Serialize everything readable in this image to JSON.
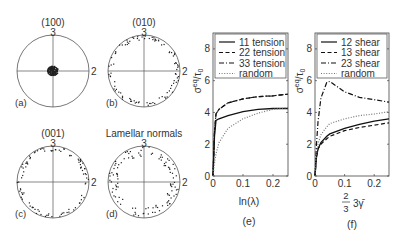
{
  "pole_figures": [
    {
      "id": "a",
      "title": "(100)",
      "panel_label": "(a)",
      "axis_top": "3",
      "axis_right": "2",
      "cx": 53,
      "cy": 71,
      "r": 36,
      "distribution": "center"
    },
    {
      "id": "b",
      "title": "(010)",
      "panel_label": "(b)",
      "axis_top": "3",
      "axis_right": "2",
      "cx": 144,
      "cy": 71,
      "r": 36,
      "distribution": "rim"
    },
    {
      "id": "c",
      "title": "(001)",
      "panel_label": "(c)",
      "axis_top": "3",
      "axis_right": "2",
      "cx": 53,
      "cy": 182,
      "r": 36,
      "distribution": "rim"
    },
    {
      "id": "d",
      "title": "Lamellar normals",
      "panel_label": "(d)",
      "axis_top": "3",
      "axis_right": "2",
      "cx": 144,
      "cy": 182,
      "r": 36,
      "distribution": "rim-inner"
    }
  ],
  "chart_data": [
    {
      "type": "line",
      "panel_label": "(e)",
      "title": "",
      "xlabel": "ln(λ)",
      "ylabel": "σeq/τ0",
      "xlim": [
        0,
        0.25
      ],
      "ylim": [
        0,
        9
      ],
      "xticks": [
        "0",
        "0.1",
        "0.2"
      ],
      "yticks": [
        "0",
        "2",
        "4",
        "6",
        "8"
      ],
      "legend_position": "upper left (inside)",
      "grid": false,
      "x": [
        0,
        0.005,
        0.01,
        0.02,
        0.05,
        0.1,
        0.15,
        0.2,
        0.25
      ],
      "series": [
        {
          "name": "11 tension",
          "style": "solid",
          "values": [
            0,
            2.5,
            3.5,
            3.6,
            3.8,
            4.05,
            4.2,
            4.25,
            4.25
          ]
        },
        {
          "name": "22 tension",
          "style": "dashed",
          "values": [
            0,
            2.8,
            3.9,
            4.2,
            4.6,
            4.85,
            5.0,
            5.05,
            5.15
          ]
        },
        {
          "name": "33 tension",
          "style": "dashdot",
          "values": [
            0,
            2.8,
            3.9,
            4.2,
            4.6,
            4.85,
            5.0,
            5.05,
            5.15
          ]
        },
        {
          "name": "random",
          "style": "dotted",
          "values": [
            0,
            0.8,
            1.4,
            2.1,
            3.0,
            3.6,
            3.95,
            4.2,
            4.3
          ]
        }
      ]
    },
    {
      "type": "line",
      "panel_label": "(f)",
      "title": "",
      "xlabel": "2/3 3γ̄",
      "ylabel": "σeq/τ0",
      "xlim": [
        0,
        0.25
      ],
      "ylim": [
        0,
        9
      ],
      "xticks": [
        "0",
        "0.1",
        "0.2"
      ],
      "yticks": [
        "0",
        "2",
        "4",
        "6",
        "8"
      ],
      "legend_position": "upper left (inside)",
      "grid": false,
      "x": [
        0,
        0.005,
        0.01,
        0.02,
        0.04,
        0.05,
        0.1,
        0.15,
        0.2,
        0.25
      ],
      "series": [
        {
          "name": "12 shear",
          "style": "solid",
          "values": [
            0,
            1.2,
            1.7,
            2.1,
            2.5,
            2.65,
            3.0,
            3.25,
            3.45,
            3.6
          ]
        },
        {
          "name": "13 shear",
          "style": "dashed",
          "values": [
            0,
            1.2,
            1.7,
            2.0,
            2.35,
            2.5,
            2.85,
            3.05,
            3.2,
            3.35
          ]
        },
        {
          "name": "23 shear",
          "style": "dashdot",
          "values": [
            0,
            2.0,
            3.4,
            4.9,
            5.9,
            5.95,
            5.3,
            4.95,
            4.8,
            4.65
          ]
        },
        {
          "name": "random",
          "style": "dotted",
          "values": [
            0,
            1.4,
            2.0,
            2.6,
            3.1,
            3.3,
            3.6,
            3.8,
            3.9,
            4.05
          ]
        }
      ]
    }
  ],
  "colors": {
    "axis": "#333333",
    "line": "#111111",
    "dots": "#222222",
    "text": "#333333"
  }
}
